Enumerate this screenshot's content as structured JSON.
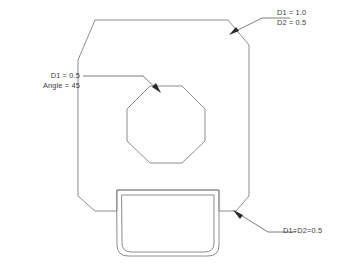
{
  "drawing": {
    "title": "Chamfered plate with octagonal hole",
    "line_color": "#8c8c8c",
    "leader_color": "#6e6e6e",
    "text_color": "#3a3a3a",
    "background_color": "#ffffff"
  },
  "annotations": {
    "top_right": {
      "name": "top-right-chamfer-callout",
      "line1": "D1 = 1.0",
      "line2": "D2 = 0.5"
    },
    "left": {
      "name": "octagon-hole-chamfer-callout",
      "line1": "D1 = 0.5",
      "line2": "Angle = 45"
    },
    "bottom_right": {
      "name": "bottom-right-chamfer-callout",
      "line1": "D1=D2=0.5"
    }
  },
  "geometry": {
    "outer_plate": {
      "name": "plate-outline",
      "description": "Chamfered plate profile with bottom notch",
      "points": "95,20 228,20 249,45 249,196 236,211 219,211 219,190 117,190 117,211 95,211 78,196 78,60"
    },
    "octagon_hole": {
      "name": "octagonal-hole",
      "description": "Regular octagon cut-out",
      "points": "150,86 182,86 205,109 205,141 182,163 150,163 127,141 127,109"
    },
    "tab_outer": {
      "name": "tab-outer-outline",
      "description": "Outer rounded tab protruding below plate",
      "path": "M117,190 L219,190 L219,245 Q219,256 208,256 L128,256 Q117,256 117,245 Z"
    },
    "tab_inner": {
      "name": "tab-inner-outline",
      "description": "Inner rounded tab offset",
      "path": "M122,195 L214,195 L214,243 Q214,252 205,252 L131,252 Q122,252 122,243 Z"
    },
    "leaders": [
      {
        "name": "leader-top-right",
        "path": "M232,33 L262,18 L290,18"
      },
      {
        "name": "leader-left",
        "path": "M83,76 L143,76 L158,90"
      },
      {
        "name": "leader-bottom-right",
        "path": "M236,212 L268,232 L296,232"
      }
    ]
  }
}
